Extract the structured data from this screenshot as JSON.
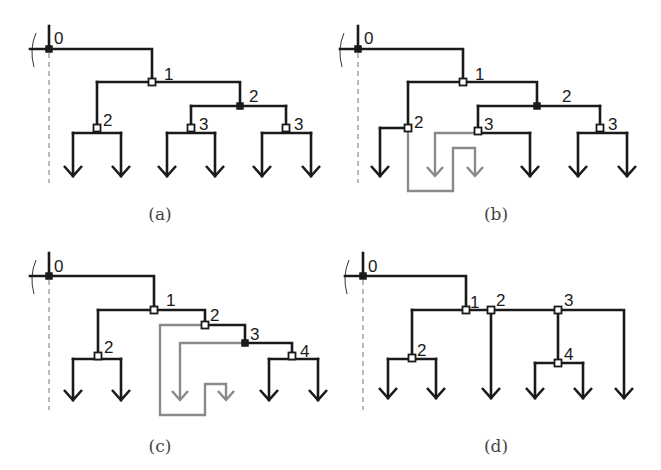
{
  "panels": [
    {
      "id": "a",
      "caption": "(a)",
      "caption_pos": [
        160,
        220
      ],
      "root": {
        "x": 49,
        "y_top": 26,
        "y_bar": 49,
        "dash_to": 183,
        "brace_x": 32
      },
      "edges": [
        "M30 49 H152 V82",
        "M97 82 H240 V106",
        "M191 106 H286",
        "M97 82 V128",
        "M191 106 V128",
        "M286 106 V128",
        "M73 133 H121",
        "M167 133 H215",
        "M262 133 H311",
        "M73 133 V176",
        "M121 133 V176",
        "M167 133 V176",
        "M215 133 V176",
        "M262 133 V176",
        "M311 133 V176"
      ],
      "gray_edges": [],
      "arrows": [
        [
          73,
          176
        ],
        [
          121,
          176
        ],
        [
          167,
          176
        ],
        [
          215,
          176
        ],
        [
          262,
          176
        ],
        [
          311,
          176
        ]
      ],
      "gray_arrows": [],
      "nodes": [
        {
          "x": 49,
          "y": 49,
          "type": "filled",
          "label": "0",
          "lx": 54,
          "ly": 40
        },
        {
          "x": 152,
          "y": 82,
          "type": "open",
          "label": "1",
          "lx": 164,
          "ly": 76
        },
        {
          "x": 97,
          "y": 128,
          "type": "open",
          "label": "2",
          "lx": 103,
          "ly": 122
        },
        {
          "x": 240,
          "y": 106,
          "type": "filled",
          "label": "2",
          "lx": 249,
          "ly": 98
        },
        {
          "x": 191,
          "y": 128,
          "type": "open",
          "label": "3",
          "lx": 199,
          "ly": 126
        },
        {
          "x": 286,
          "y": 128,
          "type": "open",
          "label": "3",
          "lx": 294,
          "ly": 126
        }
      ]
    },
    {
      "id": "b",
      "caption": "(b)",
      "caption_pos": [
        496,
        220
      ],
      "root": {
        "x": 358,
        "y_top": 26,
        "y_bar": 49,
        "dash_to": 183,
        "brace_x": 340
      },
      "edges": [
        "M340 49 H463 V82",
        "M408 82 H537 V106",
        "M478 106 H600",
        "M408 82 V128",
        "M478 106 V131",
        "M600 106 V128",
        "M380 128 H408",
        "M478 133 H530",
        "M578 133 H627",
        "M380 128 V176",
        "M530 133 V176",
        "M578 133 V176",
        "M627 133 V176"
      ],
      "gray_edges": [
        "M408 128 V191 H453 V148 H475 V176",
        "M478 133 H435 V176"
      ],
      "arrows": [
        [
          380,
          176
        ],
        [
          530,
          176
        ],
        [
          578,
          176
        ],
        [
          627,
          176
        ]
      ],
      "gray_arrows": [
        [
          435,
          176
        ],
        [
          475,
          176
        ]
      ],
      "nodes": [
        {
          "x": 358,
          "y": 49,
          "type": "filled",
          "label": "0",
          "lx": 364,
          "ly": 40
        },
        {
          "x": 463,
          "y": 82,
          "type": "open",
          "label": "1",
          "lx": 475,
          "ly": 76
        },
        {
          "x": 408,
          "y": 128,
          "type": "open",
          "label": "2",
          "lx": 414,
          "ly": 124
        },
        {
          "x": 537,
          "y": 106,
          "type": "filled",
          "label": "2",
          "lx": 562,
          "ly": 98
        },
        {
          "x": 478,
          "y": 131,
          "type": "open",
          "label": "3",
          "lx": 484,
          "ly": 126
        },
        {
          "x": 600,
          "y": 128,
          "type": "open",
          "label": "3",
          "lx": 608,
          "ly": 126
        }
      ]
    },
    {
      "id": "c",
      "caption": "(c)",
      "caption_pos": [
        160,
        452
      ],
      "root": {
        "x": 49,
        "y_top": 253,
        "y_bar": 276,
        "dash_to": 410,
        "brace_x": 32
      },
      "edges": [
        "M30 276 H154 V310",
        "M98 310 H205 V325",
        "M205 325 H245 V343",
        "M245 343 H292 V356",
        "M98 310 V356",
        "M73 359 H121",
        "M269 359 H318",
        "M73 359 V400",
        "M121 359 V400",
        "M269 359 V400",
        "M318 359 V400"
      ],
      "gray_edges": [
        "M205 325 H160 V415 H205 V384 H226 V400",
        "M245 343 H180 V400"
      ],
      "arrows": [
        [
          73,
          400
        ],
        [
          121,
          400
        ],
        [
          269,
          400
        ],
        [
          318,
          400
        ]
      ],
      "gray_arrows": [
        [
          180,
          400
        ],
        [
          226,
          400
        ]
      ],
      "nodes": [
        {
          "x": 49,
          "y": 276,
          "type": "filled",
          "label": "0",
          "lx": 54,
          "ly": 268
        },
        {
          "x": 154,
          "y": 310,
          "type": "open",
          "label": "1",
          "lx": 166,
          "ly": 302
        },
        {
          "x": 98,
          "y": 356,
          "type": "open",
          "label": "2",
          "lx": 104,
          "ly": 349
        },
        {
          "x": 205,
          "y": 325,
          "type": "open",
          "label": "2",
          "lx": 210,
          "ly": 317
        },
        {
          "x": 245,
          "y": 343,
          "type": "filled",
          "label": "3",
          "lx": 250,
          "ly": 336
        },
        {
          "x": 292,
          "y": 356,
          "type": "open",
          "label": "4",
          "lx": 300,
          "ly": 353
        }
      ]
    },
    {
      "id": "d",
      "caption": "(d)",
      "caption_pos": [
        496,
        452
      ],
      "root": {
        "x": 363,
        "y_top": 253,
        "y_bar": 276,
        "dash_to": 410,
        "brace_x": 345
      },
      "edges": [
        "M345 276 H466 V310",
        "M412 310 H624 V398",
        "M412 310 V358",
        "M491 310 V398",
        "M558 310 V363",
        "M388 359 H436",
        "M535 363 H583",
        "M388 359 V398",
        "M436 359 V398",
        "M535 363 V398",
        "M583 363 V398"
      ],
      "gray_edges": [],
      "arrows": [
        [
          388,
          398
        ],
        [
          436,
          398
        ],
        [
          491,
          398
        ],
        [
          535,
          398
        ],
        [
          583,
          398
        ],
        [
          624,
          398
        ]
      ],
      "gray_arrows": [],
      "nodes": [
        {
          "x": 363,
          "y": 276,
          "type": "filled",
          "label": "0",
          "lx": 368,
          "ly": 268
        },
        {
          "x": 466,
          "y": 310,
          "type": "open",
          "label": "1",
          "lx": 470,
          "ly": 304
        },
        {
          "x": 491,
          "y": 310,
          "type": "open",
          "label": "2",
          "lx": 496,
          "ly": 302
        },
        {
          "x": 558,
          "y": 310,
          "type": "open",
          "label": "3",
          "lx": 564,
          "ly": 302
        },
        {
          "x": 412,
          "y": 358,
          "type": "open",
          "label": "2",
          "lx": 417,
          "ly": 352
        },
        {
          "x": 558,
          "y": 363,
          "type": "open",
          "label": "4",
          "lx": 564,
          "ly": 356
        }
      ]
    }
  ]
}
